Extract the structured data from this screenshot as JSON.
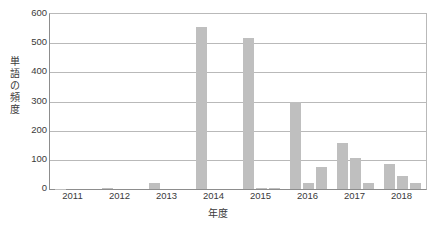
{
  "chart_data": {
    "type": "bar",
    "title": "",
    "xlabel": "年度",
    "ylabel": "単語の頻度",
    "categories": [
      "2011",
      "2012",
      "2013",
      "2014",
      "2015",
      "2016",
      "2017",
      "2018"
    ],
    "series": [
      {
        "name": "series-1",
        "values": [
          1,
          3,
          20,
          555,
          518,
          300,
          157,
          87
        ]
      },
      {
        "name": "series-2",
        "values": [
          0,
          0,
          0,
          0,
          4,
          22,
          105,
          46
        ]
      },
      {
        "name": "series-3",
        "values": [
          0,
          0,
          0,
          0,
          4,
          76,
          22,
          19
        ]
      }
    ],
    "ylim": [
      0,
      600
    ],
    "ytick_labels": [
      "0",
      "100",
      "200",
      "300",
      "400",
      "500",
      "600"
    ],
    "ytick_values": [
      0,
      100,
      200,
      300,
      400,
      500,
      600
    ],
    "grid": true,
    "legend": "none",
    "bars_per_group": 3,
    "bar_color": "#bfbfbf",
    "gridline_color": "#b9b9b9",
    "axis_color": "#8d8d8d",
    "text_color": "#3a3a3a",
    "background_color": "#ffffff"
  }
}
